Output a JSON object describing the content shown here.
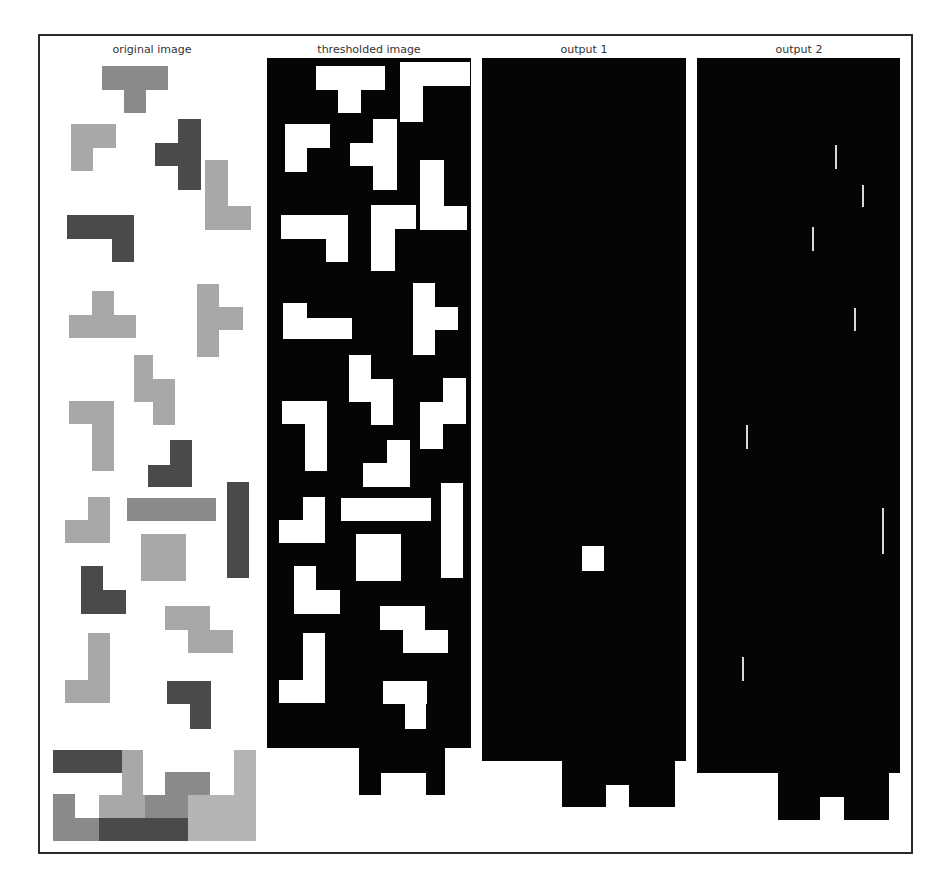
{
  "figure": {
    "panels": [
      {
        "id": "original",
        "title": "original image"
      },
      {
        "id": "thresholded",
        "title": "thresholded image"
      },
      {
        "id": "output1",
        "title": "output 1"
      },
      {
        "id": "output2",
        "title": "output 2"
      }
    ]
  },
  "colors": {
    "frame": "#2a2a2a",
    "black": "#050505",
    "white": "#ffffff",
    "dark": "#4a4a4a",
    "mid": "#8a8a8a",
    "light": "#a8a8a8",
    "lighter": "#b4b4b4"
  },
  "original_pieces": [
    {
      "name": "t-piece-top",
      "c": "mid",
      "r": [
        [
          102,
          66,
          66,
          24
        ],
        [
          124,
          90,
          22,
          23
        ]
      ]
    },
    {
      "name": "l-piece-1",
      "c": "light",
      "r": [
        [
          71,
          124,
          45,
          24
        ],
        [
          71,
          148,
          22,
          23
        ]
      ]
    },
    {
      "name": "t-piece-dark",
      "c": "dark",
      "r": [
        [
          178,
          119,
          23,
          71
        ],
        [
          155,
          143,
          23,
          23
        ]
      ]
    },
    {
      "name": "l-piece-right",
      "c": "light",
      "r": [
        [
          205,
          160,
          23,
          70
        ],
        [
          228,
          206,
          23,
          24
        ]
      ]
    },
    {
      "name": "l-piece-dark",
      "c": "dark",
      "r": [
        [
          67,
          215,
          67,
          24
        ],
        [
          112,
          239,
          22,
          23
        ]
      ]
    },
    {
      "name": "t-piece-light",
      "c": "light",
      "r": [
        [
          92,
          291,
          22,
          24
        ],
        [
          69,
          315,
          67,
          23
        ]
      ]
    },
    {
      "name": "t-piece-right",
      "c": "light",
      "r": [
        [
          197,
          284,
          22,
          73
        ],
        [
          219,
          307,
          24,
          23
        ]
      ]
    },
    {
      "name": "s-piece",
      "c": "light",
      "r": [
        [
          134,
          355,
          19,
          47
        ],
        [
          153,
          379,
          22,
          46
        ]
      ]
    },
    {
      "name": "l-piece-2",
      "c": "light",
      "r": [
        [
          69,
          401,
          45,
          23
        ],
        [
          92,
          424,
          22,
          47
        ]
      ]
    },
    {
      "name": "j-piece-dark",
      "c": "dark",
      "r": [
        [
          170,
          440,
          22,
          47
        ],
        [
          148,
          465,
          22,
          22
        ]
      ]
    },
    {
      "name": "j-piece-light",
      "c": "light",
      "r": [
        [
          88,
          497,
          22,
          46
        ],
        [
          65,
          520,
          23,
          23
        ]
      ]
    },
    {
      "name": "i-piece-horizontal",
      "c": "mid",
      "r": [
        [
          127,
          498,
          89,
          23
        ]
      ]
    },
    {
      "name": "i-piece-vertical",
      "c": "dark",
      "r": [
        [
          227,
          482,
          22,
          96
        ]
      ]
    },
    {
      "name": "o-piece",
      "c": "light",
      "r": [
        [
          141,
          534,
          45,
          47
        ]
      ]
    },
    {
      "name": "l-piece-dark-2",
      "c": "dark",
      "r": [
        [
          81,
          566,
          22,
          48
        ],
        [
          103,
          590,
          23,
          24
        ]
      ]
    },
    {
      "name": "z-piece",
      "c": "light",
      "r": [
        [
          165,
          606,
          45,
          24
        ],
        [
          188,
          630,
          45,
          23
        ]
      ]
    },
    {
      "name": "j-piece-light-2",
      "c": "light",
      "r": [
        [
          88,
          633,
          22,
          70
        ],
        [
          65,
          680,
          23,
          23
        ]
      ]
    },
    {
      "name": "j-piece-dark-2",
      "c": "dark",
      "r": [
        [
          167,
          681,
          44,
          23
        ],
        [
          190,
          704,
          21,
          25
        ]
      ]
    },
    {
      "name": "stack-dark-bar",
      "c": "dark",
      "r": [
        [
          53,
          750,
          69,
          23
        ]
      ]
    },
    {
      "name": "stack-light-col",
      "c": "light",
      "r": [
        [
          122,
          750,
          21,
          45
        ]
      ]
    },
    {
      "name": "stack-mid-block",
      "c": "mid",
      "r": [
        [
          165,
          772,
          45,
          23
        ]
      ]
    },
    {
      "name": "stack-right-col",
      "c": "lighter",
      "r": [
        [
          234,
          750,
          22,
          91
        ]
      ]
    },
    {
      "name": "stack-base-left",
      "c": "mid",
      "r": [
        [
          53,
          794,
          22,
          47
        ],
        [
          75,
          818,
          24,
          23
        ]
      ]
    },
    {
      "name": "stack-mid-2",
      "c": "light",
      "r": [
        [
          99,
          795,
          46,
          23
        ]
      ]
    },
    {
      "name": "stack-mid-3",
      "c": "mid",
      "r": [
        [
          145,
          795,
          43,
          23
        ]
      ]
    },
    {
      "name": "stack-dark-base",
      "c": "dark",
      "r": [
        [
          99,
          818,
          89,
          23
        ]
      ]
    },
    {
      "name": "stack-light-base",
      "c": "lighter",
      "r": [
        [
          188,
          795,
          46,
          46
        ]
      ]
    }
  ],
  "thresholded": {
    "body": [
      267,
      58,
      204,
      690
    ],
    "tab": [
      359,
      748,
      86,
      47
    ],
    "notch": [
      381,
      773,
      45,
      22
    ],
    "white": [
      [
        316,
        66,
        69,
        24
      ],
      [
        338,
        90,
        23,
        23
      ],
      [
        400,
        62,
        70,
        24
      ],
      [
        400,
        86,
        23,
        36
      ],
      [
        285,
        124,
        45,
        24
      ],
      [
        285,
        148,
        22,
        24
      ],
      [
        373,
        119,
        24,
        71
      ],
      [
        350,
        143,
        23,
        23
      ],
      [
        420,
        160,
        24,
        70
      ],
      [
        444,
        206,
        23,
        24
      ],
      [
        281,
        215,
        67,
        24
      ],
      [
        326,
        239,
        22,
        23
      ],
      [
        371,
        205,
        45,
        24
      ],
      [
        371,
        229,
        24,
        42
      ],
      [
        283,
        303,
        24,
        25
      ],
      [
        283,
        318,
        69,
        21
      ],
      [
        413,
        283,
        22,
        72
      ],
      [
        435,
        307,
        23,
        23
      ],
      [
        349,
        355,
        22,
        47
      ],
      [
        371,
        379,
        22,
        46
      ],
      [
        282,
        401,
        45,
        23
      ],
      [
        305,
        424,
        22,
        47
      ],
      [
        387,
        440,
        23,
        47
      ],
      [
        363,
        463,
        24,
        24
      ],
      [
        443,
        378,
        23,
        46
      ],
      [
        420,
        402,
        23,
        47
      ],
      [
        303,
        497,
        22,
        46
      ],
      [
        279,
        520,
        24,
        23
      ],
      [
        341,
        498,
        90,
        23
      ],
      [
        441,
        483,
        22,
        95
      ],
      [
        356,
        534,
        45,
        47
      ],
      [
        294,
        566,
        22,
        48
      ],
      [
        316,
        590,
        24,
        24
      ],
      [
        380,
        606,
        45,
        24
      ],
      [
        403,
        630,
        45,
        23
      ],
      [
        303,
        633,
        22,
        70
      ],
      [
        279,
        680,
        24,
        23
      ],
      [
        383,
        681,
        44,
        23
      ],
      [
        405,
        704,
        21,
        25
      ]
    ]
  },
  "output1": {
    "body": [
      482,
      58,
      204,
      703
    ],
    "tab": [
      562,
      761,
      113,
      46
    ],
    "notch": [
      606,
      785,
      23,
      22
    ],
    "white": [
      [
        582,
        546,
        22,
        25
      ]
    ]
  },
  "output2": {
    "body": [
      697,
      58,
      203,
      715
    ],
    "tab": [
      778,
      773,
      111,
      47
    ],
    "notch": [
      820,
      797,
      24,
      23
    ],
    "lines": [
      [
        835,
        145,
        2,
        24
      ],
      [
        862,
        185,
        2,
        22
      ],
      [
        812,
        227,
        2,
        24
      ],
      [
        854,
        308,
        2,
        23
      ],
      [
        746,
        425,
        2,
        24
      ],
      [
        882,
        508,
        2,
        46
      ],
      [
        742,
        657,
        2,
        24
      ]
    ]
  }
}
